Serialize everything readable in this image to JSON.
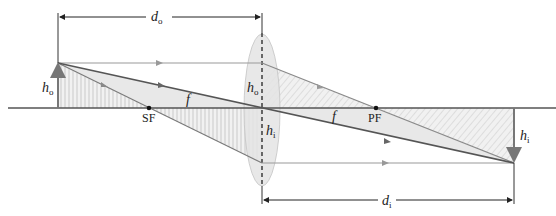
{
  "diagram": {
    "labels": {
      "object_distance": {
        "main": "d",
        "sub": "o"
      },
      "image_distance": {
        "main": "d",
        "sub": "i"
      },
      "object_height_left": {
        "main": "h",
        "sub": "o"
      },
      "object_height_lens": {
        "main": "h",
        "sub": "o"
      },
      "image_height_lens": {
        "main": "h",
        "sub": "i"
      },
      "image_height_right": {
        "main": "h",
        "sub": "i"
      },
      "focal_length_left": "f",
      "focal_length_right": "f",
      "secondary_focus": "SF",
      "primary_focus": "PF"
    },
    "colors": {
      "ray": "#8a8a8a",
      "dark_ray": "#555555",
      "axis": "#555555",
      "lens_fill": "#e6e6e6",
      "shade": "#e9e9e9",
      "hatch": "#b5b5b5",
      "dimension": "#222222"
    }
  }
}
